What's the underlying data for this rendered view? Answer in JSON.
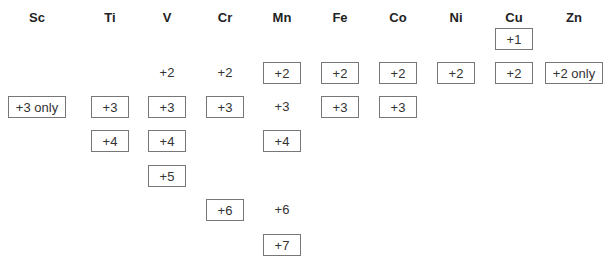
{
  "elements": [
    "Sc",
    "Ti",
    "V",
    "Cr",
    "Mn",
    "Fe",
    "Co",
    "Ni",
    "Cu",
    "Zn"
  ],
  "row_labels": [
    "+1",
    "+2",
    "+3",
    "+4",
    "+5",
    "+6",
    "+7"
  ],
  "cells": {
    "Sc": [
      {
        "state": "+3 only",
        "row": "+3",
        "boxed": true
      }
    ],
    "Ti": [
      {
        "state": "+3",
        "row": "+3",
        "boxed": true
      },
      {
        "state": "+4",
        "row": "+4",
        "boxed": true
      }
    ],
    "V": [
      {
        "state": "+2",
        "row": "+2",
        "boxed": false
      },
      {
        "state": "+3",
        "row": "+3",
        "boxed": true
      },
      {
        "state": "+4",
        "row": "+4",
        "boxed": true
      },
      {
        "state": "+5",
        "row": "+5",
        "boxed": true
      }
    ],
    "Cr": [
      {
        "state": "+2",
        "row": "+2",
        "boxed": false
      },
      {
        "state": "+3",
        "row": "+3",
        "boxed": true
      },
      {
        "state": "+6",
        "row": "+6",
        "boxed": true
      }
    ],
    "Mn": [
      {
        "state": "+2",
        "row": "+2",
        "boxed": true
      },
      {
        "state": "+3",
        "row": "+3",
        "boxed": false
      },
      {
        "state": "+4",
        "row": "+4",
        "boxed": true
      },
      {
        "state": "+6",
        "row": "+6",
        "boxed": false
      },
      {
        "state": "+7",
        "row": "+7",
        "boxed": true
      }
    ],
    "Fe": [
      {
        "state": "+2",
        "row": "+2",
        "boxed": true
      },
      {
        "state": "+3",
        "row": "+3",
        "boxed": true
      }
    ],
    "Co": [
      {
        "state": "+2",
        "row": "+2",
        "boxed": true
      },
      {
        "state": "+3",
        "row": "+3",
        "boxed": true
      }
    ],
    "Ni": [
      {
        "state": "+2",
        "row": "+2",
        "boxed": true
      }
    ],
    "Cu": [
      {
        "state": "+1",
        "row": "+1",
        "boxed": true
      },
      {
        "state": "+2",
        "row": "+2",
        "boxed": true
      }
    ],
    "Zn": [
      {
        "state": "+2 only",
        "row": "+2",
        "boxed": true
      }
    ]
  },
  "legend_note": "Boxed = common/stable oxidation state; unboxed = less common"
}
